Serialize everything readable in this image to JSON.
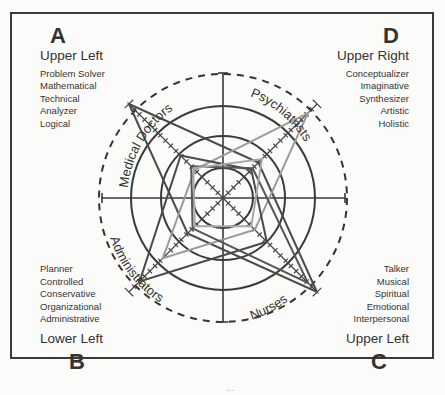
{
  "quadrants": {
    "A": {
      "letter": "A",
      "title": "Upper Left",
      "items": [
        "Problem Solver",
        "Mathematical",
        "Technical",
        "Analyzer",
        "Logical"
      ]
    },
    "D": {
      "letter": "D",
      "title": "Upper Right",
      "items": [
        "Conceptualizer",
        "Imaginative",
        "Synthesizer",
        "Artistic",
        "Holistic"
      ]
    },
    "B": {
      "letter": "B",
      "title": "Lower Left",
      "items": [
        "Planner",
        "Controlled",
        "Conservative",
        "Organizational",
        "Administrative"
      ]
    },
    "C": {
      "letter": "C",
      "title": "Upper Left",
      "items": [
        "Talker",
        "Musical",
        "Spiritual",
        "Emotional",
        "Interpersonal"
      ]
    }
  },
  "axes_labels": {
    "upper_left": "Medical Doctors",
    "upper_right": "Psychiatrists",
    "lower_left": "Administrators",
    "lower_right": "Nurses"
  },
  "chart_data": {
    "type": "radar",
    "title": "",
    "axes": [
      "A - Upper Left",
      "D - Upper Right",
      "C - Lower Right",
      "B - Lower Left"
    ],
    "axis_directions_deg": [
      135,
      45,
      -45,
      -135
    ],
    "rings": [
      "inner",
      "middle",
      "outer",
      "dashed boundary"
    ],
    "ring_radii_px": [
      30,
      62,
      92,
      124
    ],
    "scale": {
      "min": 0,
      "max": 133,
      "ticks_per_axis": 18
    },
    "group_labels": [
      "Medical Doctors",
      "Psychiatrists",
      "Administrators",
      "Nurses"
    ],
    "series": [
      {
        "name": "Medical Doctors (dark)",
        "values": [
          133,
          50,
          133,
          50
        ],
        "color": "#4a4a4a"
      },
      {
        "name": "Psychiatrists (light)",
        "values": [
          40,
          120,
          45,
          85
        ],
        "color": "#9a9a9a"
      },
      {
        "name": "Administrators (dark)",
        "values": [
          60,
          40,
          62,
          118
        ],
        "color": "#4a4a4a"
      },
      {
        "name": "Nurses (dark)",
        "values": [
          45,
          42,
          120,
          43
        ],
        "color": "#555555"
      },
      {
        "name": "Inner profile (light)",
        "values": [
          42,
          55,
          40,
          40
        ],
        "color": "#a8a8a8"
      }
    ],
    "grid": true,
    "legend": "none"
  },
  "caption": "..."
}
